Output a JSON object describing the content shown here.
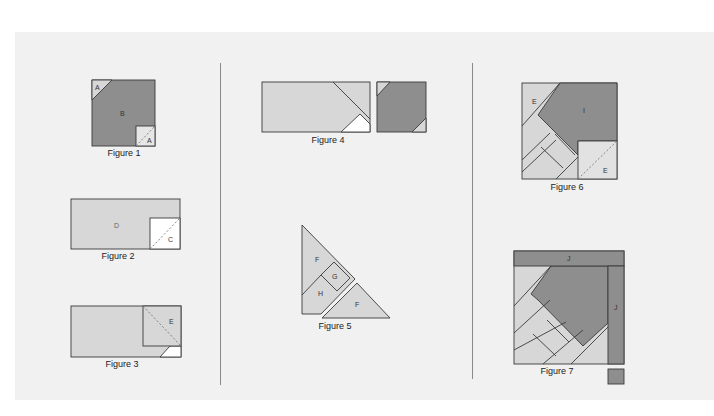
{
  "colors": {
    "dark": "#8e8e8e",
    "light": "#d7d7d7",
    "white": "#ffffff",
    "stroke": "#3a3a3a",
    "background": "#f1f1f1"
  },
  "figures": [
    {
      "id": "figure-1",
      "caption": "Figure 1",
      "labels": [
        "A",
        "B",
        "A"
      ]
    },
    {
      "id": "figure-2",
      "caption": "Figure 2",
      "labels": [
        "D",
        "C"
      ]
    },
    {
      "id": "figure-3",
      "caption": "Figure 3",
      "labels": [
        "E"
      ]
    },
    {
      "id": "figure-4",
      "caption": "Figure 4",
      "labels": []
    },
    {
      "id": "figure-5",
      "caption": "Figure 5",
      "labels": [
        "F",
        "G",
        "H",
        "F"
      ]
    },
    {
      "id": "figure-6",
      "caption": "Figure 6",
      "labels": [
        "E",
        "I",
        "E"
      ]
    },
    {
      "id": "figure-7",
      "caption": "Figure 7",
      "labels": [
        "J",
        "J"
      ]
    }
  ]
}
